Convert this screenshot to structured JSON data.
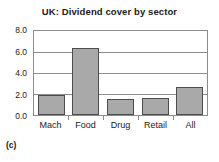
{
  "caption": "(c)",
  "chart_data": {
    "type": "bar",
    "title": "UK: Dividend cover by sector",
    "xlabel": "",
    "ylabel": "",
    "categories": [
      "Mach",
      "Food",
      "Drug",
      "Retail",
      "All"
    ],
    "values": [
      1.95,
      6.4,
      1.55,
      1.6,
      2.7
    ],
    "ylim": [
      0.0,
      8.0
    ],
    "yticks": [
      "0.0",
      "2.0",
      "4.0",
      "6.0",
      "8.0"
    ],
    "ytick_values": [
      0.0,
      2.0,
      4.0,
      6.0,
      8.0
    ],
    "grid": true,
    "legend": null,
    "bar_color": "#a9a9a9",
    "bar_edge_color": "#4d4d4d",
    "axis_color": "#8c8c8c",
    "text_color": "#1a1a1a",
    "background": "#ffffff"
  }
}
